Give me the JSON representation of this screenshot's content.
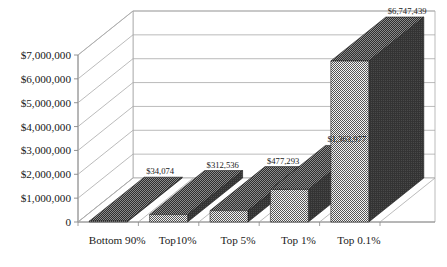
{
  "chart_data": {
    "type": "bar",
    "title": "",
    "subtitle": "",
    "xlabel": "",
    "ylabel": "",
    "categories": [
      "Bottom 90%",
      "Top10%",
      "Top 5%",
      "Top 1%",
      "Top 0.1%"
    ],
    "values": [
      34074,
      312536,
      477293,
      1363977,
      6747439
    ],
    "data_labels": [
      "$34,074",
      "$312,536",
      "$477,293",
      "$1,363,977",
      "$6,747,439"
    ],
    "ylim": [
      0,
      7000000
    ],
    "ytick_values": [
      0,
      1000000,
      2000000,
      3000000,
      4000000,
      5000000,
      6000000,
      7000000
    ],
    "ytick_labels": [
      "0",
      "$1,000,000",
      "$2,000,000",
      "$3,000,000",
      "$4,000,000",
      "$5,000,000",
      "$6,000,000",
      "$7,000,000"
    ],
    "grid": true,
    "legend": "none",
    "style": "3d-column",
    "series": [
      {
        "name": "",
        "values": [
          34074,
          312536,
          477293,
          1363977,
          6747439
        ]
      }
    ],
    "colors": {
      "bar_front": "#8c8c8c",
      "bar_side": "#3a3a3a",
      "bar_top": "#4a4a4a",
      "gridline": "#aaaaaa",
      "wall": "#ffffff",
      "axis": "#888888",
      "text": "#1a1a1a"
    }
  }
}
